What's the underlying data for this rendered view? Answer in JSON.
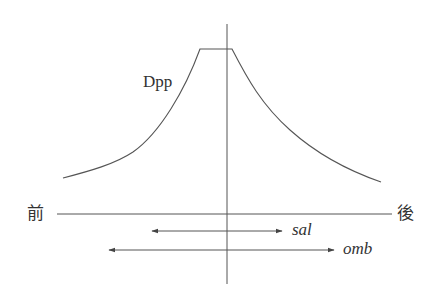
{
  "diagram": {
    "curve": {
      "label": "Dpp",
      "shape": "plateau-peak gradient, decaying toward both ends",
      "color": "#555555"
    },
    "axis": {
      "anterior_label": "前",
      "posterior_label": "後",
      "color": "#555555"
    },
    "midline": {
      "orientation": "vertical",
      "color": "#555555"
    },
    "domains": [
      {
        "name": "sal",
        "label": "sal",
        "extent": "narrow, double-headed arrow"
      },
      {
        "name": "omb",
        "label": "omb",
        "extent": "wide, double-headed arrow"
      }
    ]
  }
}
